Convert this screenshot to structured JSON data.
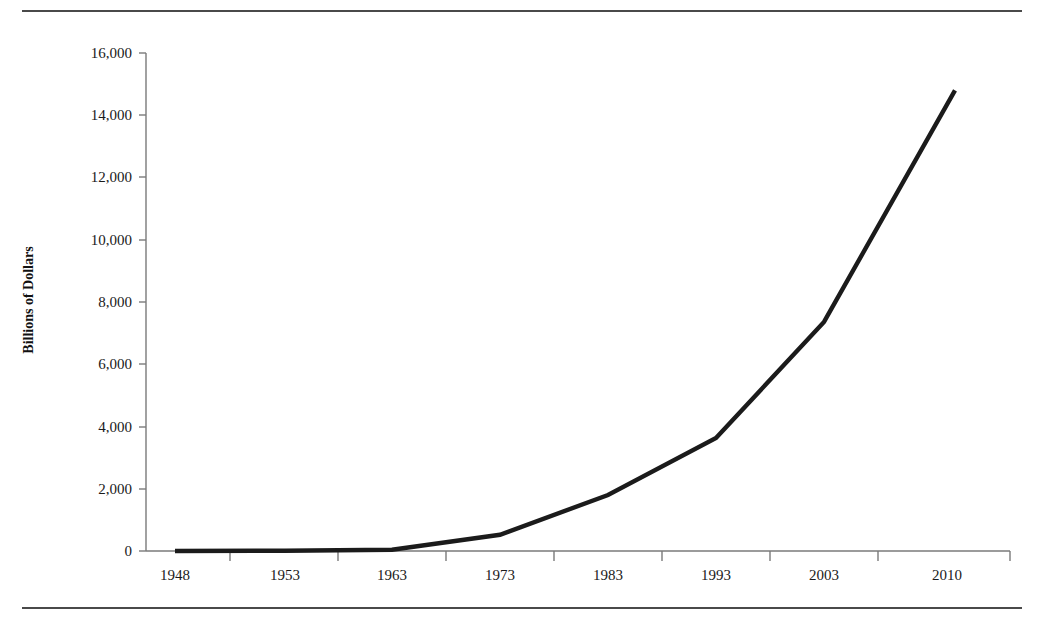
{
  "figure": {
    "name": "line-chart-figure",
    "has_top_rule": true,
    "has_bottom_rule": true,
    "background_color": "#ffffff",
    "line_color": "#1b1b1b",
    "axis_color": "#7a7a7a",
    "text_color": "#1a1a1a"
  },
  "chart_data": {
    "type": "line",
    "title": "",
    "xlabel": "",
    "ylabel": "Billions of Dollars",
    "categories": [
      "1948",
      "1953",
      "1963",
      "1973",
      "1983",
      "1993",
      "2003",
      "2010"
    ],
    "series": [
      {
        "name": "Billions of Dollars",
        "values": [
          0,
          10,
          40,
          520,
          1800,
          3630,
          7360,
          14800
        ]
      }
    ],
    "ylim": [
      0,
      16000
    ],
    "ytick_labels": [
      "0",
      "2,000",
      "4,000",
      "6,000",
      "8,000",
      "10,000",
      "12,000",
      "14,000",
      "16,000"
    ],
    "ytick_values": [
      0,
      2000,
      4000,
      6000,
      8000,
      10000,
      12000,
      14000,
      16000
    ],
    "grid": false,
    "legend": false,
    "legend_position": "none"
  }
}
